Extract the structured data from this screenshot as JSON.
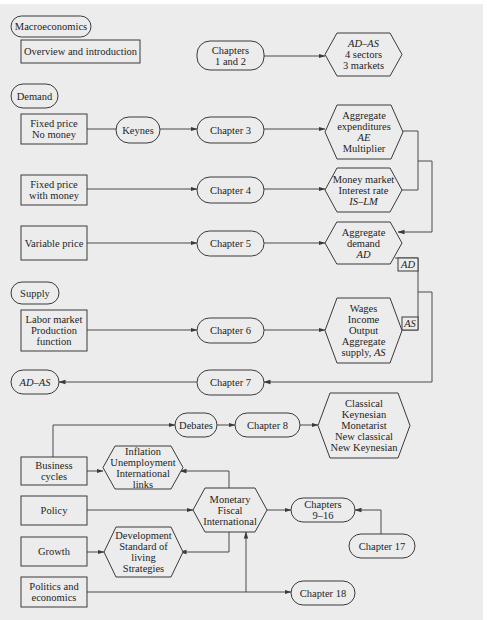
{
  "colors": {
    "background": "#ececec",
    "stroke": "#3a3a3a",
    "text": "#1e1e1e"
  },
  "nodes": {
    "macroeconomics": {
      "shape": "pill",
      "lines": [
        "Macroeconomics"
      ]
    },
    "overview": {
      "shape": "box",
      "lines": [
        "Overview and introduction"
      ]
    },
    "ch1_2": {
      "shape": "pill",
      "lines": [
        "Chapters",
        "1 and 2"
      ]
    },
    "adas_top": {
      "shape": "hexagon",
      "lines": [
        "AD–AS",
        "4 sectors",
        "3 markets"
      ],
      "italic": [
        0
      ]
    },
    "demand": {
      "shape": "pill",
      "lines": [
        "Demand"
      ]
    },
    "fixed_nomoney": {
      "shape": "box",
      "lines": [
        "Fixed price",
        "No money"
      ]
    },
    "keynes": {
      "shape": "pill",
      "lines": [
        "Keynes"
      ]
    },
    "ch3": {
      "shape": "pill",
      "lines": [
        "Chapter 3"
      ]
    },
    "ae": {
      "shape": "hexagon",
      "lines": [
        "Aggregate",
        "expenditures",
        "AE",
        "Multiplier"
      ],
      "italic": [
        2
      ]
    },
    "fixed_money": {
      "shape": "box",
      "lines": [
        "Fixed price",
        "with money"
      ]
    },
    "ch4": {
      "shape": "pill",
      "lines": [
        "Chapter 4"
      ]
    },
    "moneymarket": {
      "shape": "hexagon",
      "lines": [
        "Money market",
        "Interest rate",
        "IS–LM"
      ],
      "italic": [
        2
      ]
    },
    "variable": {
      "shape": "box",
      "lines": [
        "Variable price"
      ]
    },
    "ch5": {
      "shape": "pill",
      "lines": [
        "Chapter 5"
      ]
    },
    "ad": {
      "shape": "hexagon",
      "lines": [
        "Aggregate",
        "demand",
        "AD"
      ],
      "italic": [
        2
      ]
    },
    "supply": {
      "shape": "pill",
      "lines": [
        "Supply"
      ]
    },
    "labor": {
      "shape": "box",
      "lines": [
        "Labor market",
        "Production",
        "function"
      ]
    },
    "ch6": {
      "shape": "pill",
      "lines": [
        "Chapter 6"
      ]
    },
    "wages": {
      "shape": "hexagon",
      "lines": [
        "Wages",
        "Income",
        "Output",
        "Aggregate",
        "supply, AS"
      ],
      "italic_suffix": {
        "4": "AS"
      }
    },
    "adas_bottom": {
      "shape": "pill",
      "lines": [
        "AD–AS"
      ],
      "italic": [
        0
      ]
    },
    "ch7": {
      "shape": "pill",
      "lines": [
        "Chapter 7"
      ]
    },
    "debates": {
      "shape": "pill",
      "lines": [
        "Debates"
      ]
    },
    "ch8": {
      "shape": "pill",
      "lines": [
        "Chapter 8"
      ]
    },
    "schools": {
      "shape": "hexagon",
      "lines": [
        "Classical",
        "Keynesian",
        "Monetarist",
        "New classical",
        "New Keynesian"
      ]
    },
    "business": {
      "shape": "box",
      "lines": [
        "Business",
        "cycles"
      ]
    },
    "inflation": {
      "shape": "hexagon",
      "lines": [
        "Inflation",
        "Unemployment",
        "International",
        "links"
      ]
    },
    "policy": {
      "shape": "box",
      "lines": [
        "Policy"
      ]
    },
    "monetary": {
      "shape": "hexagon",
      "lines": [
        "Monetary",
        "Fiscal",
        "International"
      ]
    },
    "ch9_16": {
      "shape": "pill",
      "lines": [
        "Chapters",
        "9–16"
      ]
    },
    "growth": {
      "shape": "box",
      "lines": [
        "Growth"
      ]
    },
    "development": {
      "shape": "hexagon",
      "lines": [
        "Development",
        "Standard of",
        "living",
        "Strategies"
      ]
    },
    "ch17": {
      "shape": "pill",
      "lines": [
        "Chapter 17"
      ]
    },
    "politics": {
      "shape": "box",
      "lines": [
        "Politics and",
        "economics"
      ]
    },
    "ch18": {
      "shape": "pill",
      "lines": [
        "Chapter 18"
      ]
    }
  },
  "edge_labels": {
    "ad": "AD",
    "as": "AS"
  },
  "edges": [
    [
      "ch1_2",
      "adas_top"
    ],
    [
      "fixed_nomoney",
      "keynes"
    ],
    [
      "keynes",
      "ch3"
    ],
    [
      "ch3",
      "ae"
    ],
    [
      "fixed_money",
      "ch4"
    ],
    [
      "ch4",
      "moneymarket"
    ],
    [
      "ae",
      "ad"
    ],
    [
      "moneymarket",
      "ad"
    ],
    [
      "variable",
      "ch5"
    ],
    [
      "ch5",
      "ad"
    ],
    [
      "labor",
      "ch6"
    ],
    [
      "ch6",
      "wages"
    ],
    [
      "ad",
      "ch7"
    ],
    [
      "wages",
      "ch7"
    ],
    [
      "ch7",
      "adas_bottom"
    ],
    [
      "business",
      "debates"
    ],
    [
      "debates",
      "ch8"
    ],
    [
      "ch8",
      "schools"
    ],
    [
      "business",
      "inflation"
    ],
    [
      "monetary",
      "inflation"
    ],
    [
      "policy",
      "monetary"
    ],
    [
      "monetary",
      "ch9_16"
    ],
    [
      "ch17",
      "ch9_16"
    ],
    [
      "monetary",
      "development"
    ],
    [
      "growth",
      "development"
    ],
    [
      "politics",
      "monetary"
    ],
    [
      "politics",
      "ch18"
    ]
  ]
}
